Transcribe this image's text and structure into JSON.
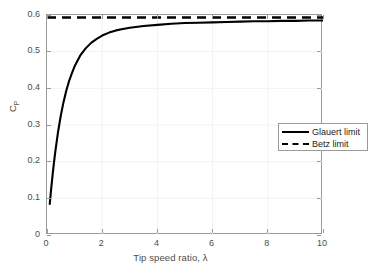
{
  "figure": {
    "background_color": "#ffffff",
    "axes_color": "#9a9a9a",
    "text_color": "#4d4d4d",
    "line_color": "#000000"
  },
  "axis": {
    "x_title": "Tip speed ratio, λ",
    "y_title_main": "C",
    "y_title_sub": "P",
    "x_ticks": [
      "0",
      "2",
      "4",
      "6",
      "8",
      "10"
    ],
    "y_ticks": [
      "0",
      "0.1",
      "0.2",
      "0.3",
      "0.4",
      "0.5",
      "0.6"
    ]
  },
  "legend": {
    "entries": [
      {
        "label": "Glauert limit",
        "style": "solid"
      },
      {
        "label": "Betz limit",
        "style": "dashed"
      }
    ]
  },
  "chart_data": {
    "type": "line",
    "title": "",
    "xlabel": "Tip speed ratio, λ",
    "ylabel": "C_P",
    "xlim": [
      0,
      10
    ],
    "ylim": [
      0,
      0.6
    ],
    "xticks": [
      0,
      2,
      4,
      6,
      8,
      10
    ],
    "yticks": [
      0,
      0.1,
      0.2,
      0.3,
      0.4,
      0.5,
      0.6
    ],
    "grid": true,
    "legend_position": "upper right (inside axes)",
    "series": [
      {
        "name": "Glauert limit",
        "style": "solid",
        "color": "#000000",
        "linewidth": 2,
        "x": [
          0.1,
          0.15,
          0.2,
          0.25,
          0.3,
          0.4,
          0.5,
          0.6,
          0.7,
          0.8,
          0.9,
          1.0,
          1.2,
          1.4,
          1.6,
          1.8,
          2.0,
          2.25,
          2.5,
          2.75,
          3.0,
          3.5,
          4.0,
          4.5,
          5.0,
          5.5,
          6.0,
          6.5,
          7.0,
          7.5,
          8.0,
          8.5,
          9.0,
          9.5,
          10.0
        ],
        "y": [
          0.085,
          0.125,
          0.162,
          0.196,
          0.227,
          0.281,
          0.326,
          0.363,
          0.394,
          0.42,
          0.441,
          0.46,
          0.489,
          0.509,
          0.524,
          0.535,
          0.544,
          0.552,
          0.558,
          0.562,
          0.565,
          0.57,
          0.573,
          0.576,
          0.578,
          0.579,
          0.58,
          0.581,
          0.582,
          0.583,
          0.583,
          0.584,
          0.584,
          0.585,
          0.585
        ]
      },
      {
        "name": "Betz limit",
        "style": "dashed",
        "color": "#000000",
        "linewidth": 2,
        "x": [
          0,
          10
        ],
        "y": [
          0.593,
          0.593
        ]
      }
    ]
  }
}
